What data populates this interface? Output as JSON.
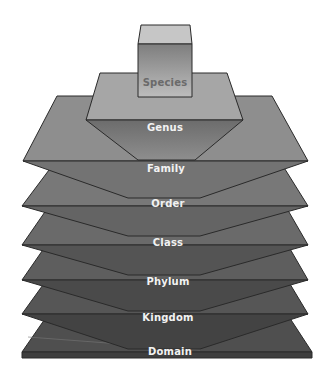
{
  "diagram": {
    "type": "stacked-layers",
    "layers": [
      {
        "label": "Species",
        "level": 1
      },
      {
        "label": "Genus",
        "level": 2
      },
      {
        "label": "Family",
        "level": 3
      },
      {
        "label": "Order",
        "level": 4
      },
      {
        "label": "Class",
        "level": 5
      },
      {
        "label": "Phylum",
        "level": 6
      },
      {
        "label": "Kingdom",
        "level": 7
      },
      {
        "label": "Domain",
        "level": 8
      }
    ]
  },
  "colors": {
    "species_top": "#c8c8c8",
    "species_front": "#8a8a8a",
    "genus_top": "#a8a8a8",
    "genus_front": "#787878",
    "family_top": "#8e8e8e",
    "family_front": "#7a7a7a",
    "order_top": "#7c7c7c",
    "order_front": "#6a6a6a",
    "class_top": "#6c6c6c",
    "class_front": "#5a5a5a",
    "phylum_top": "#606060",
    "phylum_front": "#4e4e4e",
    "kingdom_top": "#565656",
    "kingdom_front": "#464646",
    "domain_top": "#505050",
    "domain_front": "#424242",
    "outline": "#2a2a2a"
  }
}
